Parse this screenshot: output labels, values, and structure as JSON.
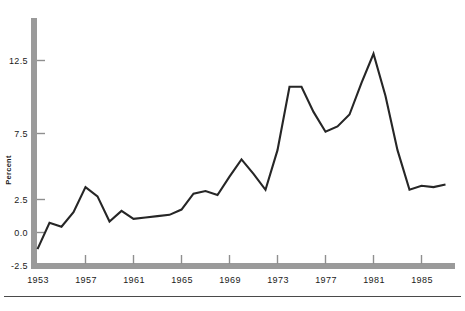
{
  "chart_data": {
    "type": "line",
    "title": "",
    "subtitle": "",
    "xlabel": "",
    "ylabel": "Percent",
    "xlim": [
      1952.2,
      1987.2
    ],
    "ylim": [
      -2.5,
      15.2
    ],
    "grid": false,
    "legend": "none",
    "x_ticks": [
      1953,
      1957,
      1961,
      1965,
      1969,
      1973,
      1977,
      1981,
      1985
    ],
    "x_tick_labels": [
      "1953",
      "1957",
      "1961",
      "1965",
      "1969",
      "1973",
      "1977",
      "1981",
      "1985"
    ],
    "y_ticks": [
      -2.5,
      0.0,
      2.5,
      7.5,
      12.5
    ],
    "y_tick_labels": [
      "-2.5",
      "0.0",
      "2.5",
      "7.5",
      "12.5"
    ],
    "series": [
      {
        "name": "Percent",
        "x": [
          1953,
          1954,
          1955,
          1956,
          1957,
          1958,
          1959,
          1960,
          1961,
          1962,
          1963,
          1964,
          1965,
          1966,
          1967,
          1968,
          1969,
          1970,
          1971,
          1972,
          1973,
          1974,
          1975,
          1976,
          1977,
          1978,
          1979,
          1980,
          1981,
          1982,
          1983,
          1984,
          1985,
          1986,
          1987
        ],
        "values": [
          -1.3,
          0.7,
          0.4,
          1.5,
          3.4,
          2.7,
          0.8,
          1.6,
          1.0,
          1.1,
          1.2,
          1.3,
          1.7,
          2.9,
          3.1,
          2.8,
          4.2,
          5.5,
          4.4,
          3.2,
          6.2,
          11.0,
          11.0,
          9.1,
          7.6,
          8.0,
          8.9,
          11.3,
          13.5,
          10.3,
          6.2,
          3.2,
          3.5,
          3.4,
          3.6
        ]
      }
    ],
    "peaks": [
      {
        "label": "1974 peak",
        "year": 1974,
        "value": 11.0
      },
      {
        "label": "1981 peak",
        "year": 1981,
        "value": 13.5
      }
    ],
    "minimum": {
      "year": 1953,
      "value": -1.3
    },
    "footer_rule": true
  }
}
